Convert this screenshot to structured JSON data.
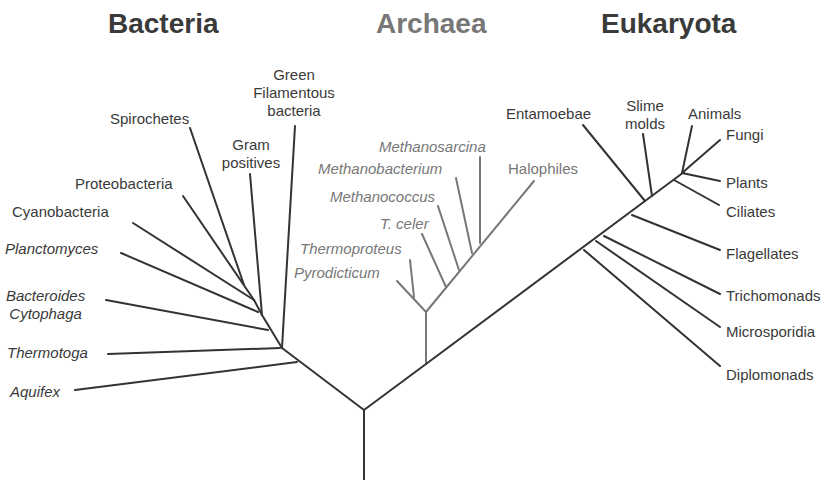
{
  "colors": {
    "bacteria": "#3a3a3a",
    "archaea": "#777777",
    "eukaryota": "#3a3a3a",
    "line_dark": "#333333",
    "line_gray": "#777777"
  },
  "domains": [
    {
      "name": "Bacteria",
      "x": 108,
      "color": "#3a3a3a"
    },
    {
      "name": "Archaea",
      "x": 376,
      "color": "#777777"
    },
    {
      "name": "Eukaryota",
      "x": 601,
      "color": "#3a3a3a"
    }
  ],
  "labels": [
    {
      "text": "Green\nFilamentous\nbacteria",
      "x": 294,
      "y": 66,
      "align": "center",
      "italic": false,
      "domain": "bacteria"
    },
    {
      "text": "Spirochetes",
      "x": 110,
      "y": 110,
      "align": "left",
      "italic": false,
      "domain": "bacteria"
    },
    {
      "text": "Gram\npositives",
      "x": 251,
      "y": 136,
      "align": "center",
      "italic": false,
      "domain": "bacteria"
    },
    {
      "text": "Proteobacteria",
      "x": 75,
      "y": 175,
      "align": "left",
      "italic": false,
      "domain": "bacteria"
    },
    {
      "text": "Cyanobacteria",
      "x": 12,
      "y": 203,
      "align": "left",
      "italic": false,
      "domain": "bacteria"
    },
    {
      "text": "Planctomyces",
      "x": 5,
      "y": 240,
      "align": "left",
      "italic": true,
      "domain": "bacteria"
    },
    {
      "text": "Bacteroides\nCytophaga",
      "x": 6,
      "y": 287,
      "align": "center-block",
      "italic": true,
      "domain": "bacteria"
    },
    {
      "text": "Thermotoga",
      "x": 7,
      "y": 344,
      "align": "left",
      "italic": true,
      "domain": "bacteria"
    },
    {
      "text": "Aquifex",
      "x": 10,
      "y": 383,
      "align": "left",
      "italic": true,
      "domain": "bacteria"
    },
    {
      "text": "Methanosarcina",
      "x": 379,
      "y": 138,
      "align": "left",
      "italic": true,
      "domain": "archaea"
    },
    {
      "text": "Methanobacterium",
      "x": 318,
      "y": 160,
      "align": "left",
      "italic": true,
      "domain": "archaea"
    },
    {
      "text": "Halophiles",
      "x": 508,
      "y": 160,
      "align": "left",
      "italic": false,
      "domain": "archaea"
    },
    {
      "text": "Methanococcus",
      "x": 330,
      "y": 188,
      "align": "left",
      "italic": true,
      "domain": "archaea"
    },
    {
      "text": "T. celer",
      "x": 380,
      "y": 215,
      "align": "left",
      "italic": true,
      "domain": "archaea"
    },
    {
      "text": "Thermoproteus",
      "x": 300,
      "y": 240,
      "align": "left",
      "italic": true,
      "domain": "archaea"
    },
    {
      "text": "Pyrodicticum",
      "x": 294,
      "y": 264,
      "align": "left",
      "italic": true,
      "domain": "archaea"
    },
    {
      "text": "Entamoebae",
      "x": 506,
      "y": 105,
      "align": "left",
      "italic": false,
      "domain": "eukaryota"
    },
    {
      "text": "Slime\nmolds",
      "x": 645,
      "y": 97,
      "align": "center",
      "italic": false,
      "domain": "eukaryota"
    },
    {
      "text": "Animals",
      "x": 688,
      "y": 105,
      "align": "left",
      "italic": false,
      "domain": "eukaryota"
    },
    {
      "text": "Fungi",
      "x": 726,
      "y": 126,
      "align": "left",
      "italic": false,
      "domain": "eukaryota"
    },
    {
      "text": "Plants",
      "x": 726,
      "y": 174,
      "align": "left",
      "italic": false,
      "domain": "eukaryota"
    },
    {
      "text": "Ciliates",
      "x": 726,
      "y": 203,
      "align": "left",
      "italic": false,
      "domain": "eukaryota"
    },
    {
      "text": "Flagellates",
      "x": 726,
      "y": 245,
      "align": "left",
      "italic": false,
      "domain": "eukaryota"
    },
    {
      "text": "Trichomonads",
      "x": 726,
      "y": 287,
      "align": "left",
      "italic": false,
      "domain": "eukaryota"
    },
    {
      "text": "Microsporidia",
      "x": 726,
      "y": 323,
      "align": "left",
      "italic": false,
      "domain": "eukaryota"
    },
    {
      "text": "Diplomonads",
      "x": 726,
      "y": 366,
      "align": "left",
      "italic": false,
      "domain": "eukaryota"
    }
  ],
  "branches": [
    {
      "name": "root",
      "x1": 364,
      "y1": 410,
      "x2": 364,
      "y2": 480,
      "color": "dark"
    },
    {
      "name": "bacteria-stem",
      "x1": 364,
      "y1": 410,
      "x2": 282,
      "y2": 348,
      "color": "dark"
    },
    {
      "name": "bacteria-inner-1",
      "x1": 282,
      "y1": 348,
      "x2": 262,
      "y2": 315,
      "color": "dark"
    },
    {
      "name": "bacteria-inner-2",
      "x1": 262,
      "y1": 315,
      "x2": 254,
      "y2": 300,
      "color": "dark"
    },
    {
      "name": "aquifex",
      "x1": 297,
      "y1": 362,
      "x2": 75,
      "y2": 390,
      "color": "dark"
    },
    {
      "name": "thermotoga",
      "x1": 280,
      "y1": 348,
      "x2": 108,
      "y2": 354,
      "color": "dark"
    },
    {
      "name": "bacteroides",
      "x1": 268,
      "y1": 330,
      "x2": 106,
      "y2": 300,
      "color": "dark"
    },
    {
      "name": "green-filamentous",
      "x1": 282,
      "y1": 348,
      "x2": 295,
      "y2": 126,
      "color": "dark"
    },
    {
      "name": "gram-positives",
      "x1": 262,
      "y1": 315,
      "x2": 250,
      "y2": 174,
      "color": "dark"
    },
    {
      "name": "planctomyces",
      "x1": 258,
      "y1": 312,
      "x2": 121,
      "y2": 253,
      "color": "dark"
    },
    {
      "name": "cyanobacteria",
      "x1": 254,
      "y1": 300,
      "x2": 133,
      "y2": 223,
      "color": "dark"
    },
    {
      "name": "proteobacteria",
      "x1": 254,
      "y1": 300,
      "x2": 183,
      "y2": 196,
      "color": "dark"
    },
    {
      "name": "spirochetes",
      "x1": 244,
      "y1": 285,
      "x2": 190,
      "y2": 128,
      "color": "dark"
    },
    {
      "name": "archaea-euk-stem",
      "x1": 364,
      "y1": 410,
      "x2": 426,
      "y2": 364,
      "color": "dark"
    },
    {
      "name": "archaea-stem",
      "x1": 426,
      "y1": 364,
      "x2": 426,
      "y2": 312,
      "color": "gray"
    },
    {
      "name": "archaea-inner",
      "x1": 426,
      "y1": 312,
      "x2": 534,
      "y2": 181,
      "color": "gray"
    },
    {
      "name": "pyrodicticum",
      "x1": 426,
      "y1": 312,
      "x2": 397,
      "y2": 281,
      "color": "gray"
    },
    {
      "name": "thermoproteus",
      "x1": 414,
      "y1": 297,
      "x2": 410,
      "y2": 260,
      "color": "gray"
    },
    {
      "name": "t-celer",
      "x1": 446,
      "y1": 287,
      "x2": 422,
      "y2": 234,
      "color": "gray"
    },
    {
      "name": "methanococcus",
      "x1": 459,
      "y1": 270,
      "x2": 438,
      "y2": 206,
      "color": "gray"
    },
    {
      "name": "methanobacterium",
      "x1": 472,
      "y1": 253,
      "x2": 456,
      "y2": 178,
      "color": "gray"
    },
    {
      "name": "methanosarcina",
      "x1": 480,
      "y1": 243,
      "x2": 480,
      "y2": 157,
      "color": "gray"
    },
    {
      "name": "euk-stem",
      "x1": 426,
      "y1": 364,
      "x2": 684,
      "y2": 172,
      "color": "dark"
    },
    {
      "name": "diplomonads",
      "x1": 584,
      "y1": 250,
      "x2": 720,
      "y2": 366,
      "color": "dark"
    },
    {
      "name": "microsporidia",
      "x1": 596,
      "y1": 241,
      "x2": 720,
      "y2": 327,
      "color": "dark"
    },
    {
      "name": "trichomonads",
      "x1": 604,
      "y1": 236,
      "x2": 720,
      "y2": 294,
      "color": "dark"
    },
    {
      "name": "flagellates",
      "x1": 632,
      "y1": 215,
      "x2": 720,
      "y2": 250,
      "color": "dark"
    },
    {
      "name": "entamoebae",
      "x1": 645,
      "y1": 201,
      "x2": 583,
      "y2": 125,
      "color": "dark"
    },
    {
      "name": "slime-molds",
      "x1": 652,
      "y1": 196,
      "x2": 643,
      "y2": 134,
      "color": "dark"
    },
    {
      "name": "ciliates",
      "x1": 674,
      "y1": 180,
      "x2": 719,
      "y2": 205,
      "color": "dark"
    },
    {
      "name": "plants",
      "x1": 682,
      "y1": 173,
      "x2": 720,
      "y2": 181,
      "color": "dark"
    },
    {
      "name": "animals",
      "x1": 682,
      "y1": 173,
      "x2": 692,
      "y2": 126,
      "color": "dark"
    },
    {
      "name": "fungi",
      "x1": 682,
      "y1": 173,
      "x2": 720,
      "y2": 140,
      "color": "dark"
    }
  ]
}
